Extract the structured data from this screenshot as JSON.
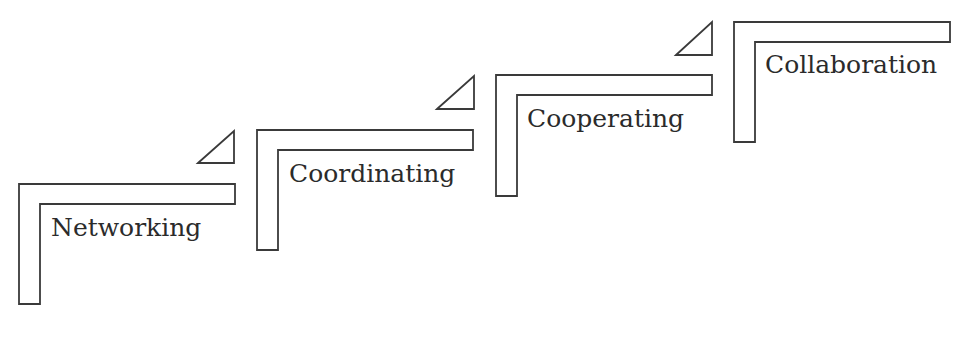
{
  "diagram": {
    "type": "staircase",
    "stroke_color": "#3a3a3a",
    "text_color": "#2b2b2b",
    "background": "#ffffff",
    "steps": [
      {
        "label": "Networking",
        "x": 19,
        "y": 184,
        "width": 216,
        "bar_height": 20,
        "post_width": 21,
        "height": 120,
        "label_x": 51,
        "label_y": 236,
        "triangle": [
          [
            198,
            163
          ],
          [
            234,
            131
          ],
          [
            234,
            163
          ]
        ]
      },
      {
        "label": "Coordinating",
        "x": 257,
        "y": 130,
        "width": 216,
        "bar_height": 20,
        "post_width": 21,
        "height": 120,
        "label_x": 289,
        "label_y": 182,
        "triangle": [
          [
            437,
            109
          ],
          [
            474,
            76
          ],
          [
            474,
            109
          ]
        ]
      },
      {
        "label": "Cooperating",
        "x": 496,
        "y": 75,
        "width": 216,
        "bar_height": 20,
        "post_width": 21,
        "height": 121,
        "label_x": 527,
        "label_y": 127,
        "triangle": [
          [
            676,
            55
          ],
          [
            712,
            22
          ],
          [
            712,
            55
          ]
        ]
      },
      {
        "label": "Collaboration",
        "x": 734,
        "y": 22,
        "width": 216,
        "bar_height": 20,
        "post_width": 21,
        "height": 120,
        "label_x": 765,
        "label_y": 73,
        "triangle": null
      }
    ]
  }
}
